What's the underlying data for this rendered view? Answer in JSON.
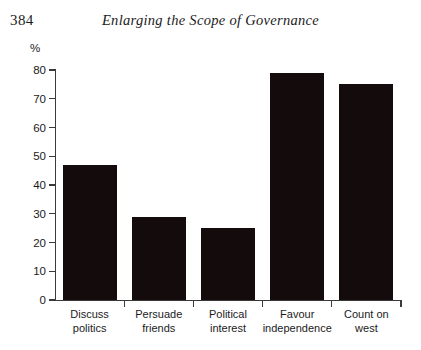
{
  "page": {
    "number": "384",
    "running_head": "Enlarging the Scope of Governance"
  },
  "chart_data": {
    "type": "bar",
    "title": "",
    "xlabel": "",
    "ylabel": "%",
    "ylim": [
      0,
      80
    ],
    "yticks": [
      0,
      10,
      20,
      30,
      40,
      50,
      60,
      70,
      80
    ],
    "ytick_labels": [
      "0",
      "10",
      "20",
      "30",
      "40",
      "50",
      "60",
      "70",
      "80"
    ],
    "grid": false,
    "legend": false,
    "bar_color": "#140c0c",
    "axis_color": "#3a3a3a",
    "categories": [
      "Discuss politics",
      "Persuade friends",
      "Political interest",
      "Favour independence",
      "Count on west"
    ],
    "category_lines": [
      [
        "Discuss",
        "politics"
      ],
      [
        "Persuade",
        "friends"
      ],
      [
        "Political",
        "interest"
      ],
      [
        "Favour",
        "independence"
      ],
      [
        "Count on",
        "west"
      ]
    ],
    "values": [
      47,
      29,
      25,
      79,
      75
    ]
  }
}
